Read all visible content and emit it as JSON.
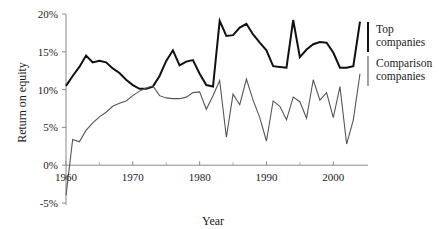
{
  "chart_data": {
    "type": "line",
    "title": "",
    "xlabel": "Year",
    "ylabel": "Return on equity",
    "xlim": [
      1960,
      2004
    ],
    "ylim": [
      -5,
      20
    ],
    "yticks": [
      -5,
      0,
      5,
      10,
      15,
      20
    ],
    "ytick_labels": [
      "-5%",
      "0%",
      "5%",
      "10%",
      "15%",
      "20%"
    ],
    "xticks": [
      1960,
      1970,
      1980,
      1990,
      2000
    ],
    "xtick_labels": [
      "1960",
      "1970",
      "1980",
      "1990",
      "2000"
    ],
    "xminorticks": [
      1965,
      1975,
      1985,
      1995
    ],
    "grid": false,
    "legend_position": "right",
    "x": [
      1960,
      1961,
      1962,
      1963,
      1964,
      1965,
      1966,
      1967,
      1968,
      1969,
      1970,
      1971,
      1972,
      1973,
      1974,
      1975,
      1976,
      1977,
      1978,
      1979,
      1980,
      1981,
      1982,
      1983,
      1984,
      1985,
      1986,
      1987,
      1988,
      1989,
      1990,
      1991,
      1992,
      1993,
      1994,
      1995,
      1996,
      1997,
      1998,
      1999,
      2000,
      2001,
      2002,
      2003,
      2004
    ],
    "series": [
      {
        "name": "Top companies",
        "color": "#111111",
        "width": 2.0,
        "values": [
          10.5,
          11.8,
          13.0,
          14.5,
          13.6,
          13.8,
          13.6,
          12.8,
          12.2,
          11.3,
          10.6,
          10.1,
          10.1,
          10.4,
          11.8,
          13.8,
          15.2,
          13.2,
          13.7,
          13.9,
          12.1,
          10.6,
          10.4,
          19.1,
          17.1,
          17.2,
          18.2,
          18.7,
          17.3,
          16.2,
          15.2,
          13.1,
          13.0,
          12.9,
          19.2,
          14.3,
          15.3,
          16.0,
          16.3,
          16.2,
          14.9,
          12.9,
          12.9,
          13.1,
          19.0
        ]
      },
      {
        "name": "Comparison companies",
        "color": "#555555",
        "width": 1.1,
        "values": [
          -4.0,
          3.4,
          3.1,
          4.6,
          5.6,
          6.4,
          7.0,
          7.8,
          8.2,
          8.5,
          9.2,
          9.8,
          10.2,
          10.5,
          9.2,
          8.9,
          8.8,
          8.8,
          9.0,
          9.6,
          9.7,
          7.4,
          9.2,
          11.2,
          3.7,
          9.4,
          8.0,
          11.4,
          8.6,
          6.3,
          3.2,
          8.5,
          7.8,
          6.0,
          9.0,
          8.4,
          6.2,
          11.3,
          8.6,
          9.6,
          6.3,
          10.4,
          2.8,
          6.0,
          12.1
        ]
      }
    ],
    "legend": [
      {
        "label_line1": "Top",
        "label_line2": "companies"
      },
      {
        "label_line1": "Comparison",
        "label_line2": "companies"
      }
    ]
  }
}
